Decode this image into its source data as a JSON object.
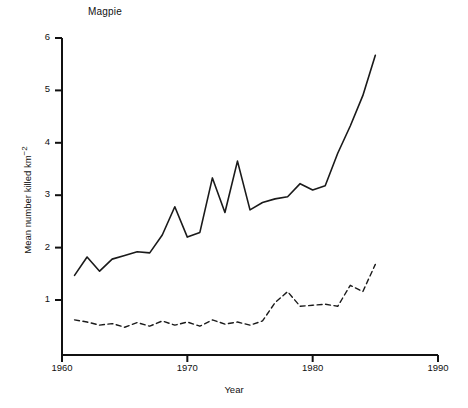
{
  "chart_data": {
    "type": "line",
    "title": "Magpie",
    "xlabel": "Year",
    "ylabel": "Mean number killed km",
    "ylabel_superscript": "−2",
    "xlim": [
      1960,
      1990
    ],
    "ylim": [
      0,
      6
    ],
    "xticks": [
      1960,
      1970,
      1980,
      1990
    ],
    "yticks": [
      1,
      2,
      3,
      4,
      5,
      6
    ],
    "grid": false,
    "legend": null,
    "x": [
      1961,
      1962,
      1963,
      1964,
      1965,
      1966,
      1967,
      1968,
      1969,
      1970,
      1971,
      1972,
      1973,
      1974,
      1975,
      1976,
      1977,
      1978,
      1979,
      1980,
      1981,
      1982,
      1983,
      1984,
      1985
    ],
    "series": [
      {
        "name": "solid-series",
        "style": "solid",
        "color": "#1a1a1a",
        "values": [
          1.47,
          1.82,
          1.55,
          1.78,
          1.85,
          1.92,
          1.9,
          2.24,
          2.78,
          2.2,
          2.29,
          3.33,
          2.67,
          3.65,
          2.72,
          2.86,
          2.93,
          2.97,
          3.22,
          3.1,
          3.18,
          3.8,
          4.32,
          4.9,
          5.67
        ]
      },
      {
        "name": "dashed-series",
        "style": "dashed",
        "color": "#1a1a1a",
        "values": [
          0.62,
          0.58,
          0.52,
          0.55,
          0.48,
          0.57,
          0.5,
          0.6,
          0.52,
          0.58,
          0.5,
          0.62,
          0.54,
          0.58,
          0.52,
          0.6,
          0.95,
          1.16,
          0.88,
          0.9,
          0.92,
          0.88,
          1.28,
          1.16,
          1.68
        ]
      }
    ]
  }
}
